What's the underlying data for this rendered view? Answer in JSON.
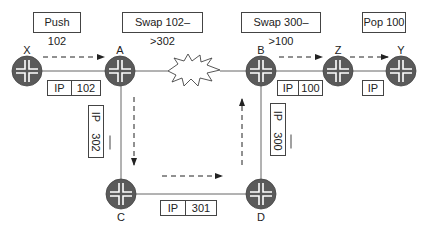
{
  "operations": {
    "push": "Push 102",
    "swap_a": "Swap 102–>302",
    "swap_b": "Swap 300–>100",
    "pop": "Pop 100"
  },
  "nodes": {
    "x": "X",
    "a": "A",
    "b": "B",
    "z": "Z",
    "y": "Y",
    "c": "C",
    "d": "D"
  },
  "packets": {
    "x_a": {
      "proto": "IP",
      "label": "102"
    },
    "a_c": {
      "proto": "IP",
      "label": "302"
    },
    "c_d": {
      "proto": "IP",
      "label": "301"
    },
    "d_b": {
      "proto": "IP",
      "label": "300"
    },
    "b_z": {
      "proto": "IP",
      "label": "100"
    },
    "z_y": {
      "proto": "IP"
    }
  },
  "link_failure": "A–B link broken",
  "colors": {
    "router_fill": "#5a5a5a",
    "router_arrows": "#ffffff",
    "link": "#555555",
    "arrow": "#333333"
  }
}
